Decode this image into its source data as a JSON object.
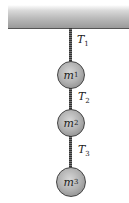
{
  "diagram": {
    "type": "hanging-masses",
    "ceiling": {
      "label": ""
    },
    "tensions": [
      {
        "symbol": "T",
        "sub": "1"
      },
      {
        "symbol": "T",
        "sub": "2"
      },
      {
        "symbol": "T",
        "sub": "3"
      }
    ],
    "masses": [
      {
        "symbol": "m",
        "sub": "1"
      },
      {
        "symbol": "m",
        "sub": "2"
      },
      {
        "symbol": "m",
        "sub": "3"
      }
    ]
  }
}
